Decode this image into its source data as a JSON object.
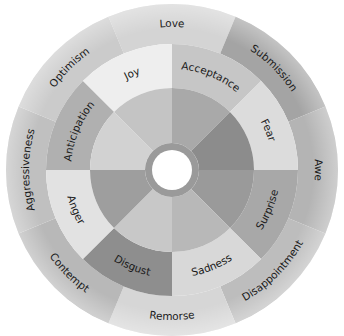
{
  "diagram": {
    "center": [
      172,
      170
    ],
    "radii": {
      "hub": 20,
      "hub_ring": 27,
      "inner": 82,
      "middle": 126,
      "outer": 166
    },
    "primary_emotions": [
      {
        "label": "Joy",
        "angle": -112.5,
        "fill": "#eeeeee",
        "inner_fill": "#c4c4c4"
      },
      {
        "label": "Acceptance",
        "angle": -67.5,
        "fill": "#c6c6c6",
        "inner_fill": "#a9a9a9"
      },
      {
        "label": "Fear",
        "angle": -22.5,
        "fill": "#dcdcdc",
        "inner_fill": "#8c8c8c"
      },
      {
        "label": "Surprise",
        "angle": 22.5,
        "fill": "#a8a8a8",
        "inner_fill": "#9a9a9a"
      },
      {
        "label": "Sadness",
        "angle": 67.5,
        "fill": "#d8d8d8",
        "inner_fill": "#b8b8b8"
      },
      {
        "label": "Disgust",
        "angle": 112.5,
        "fill": "#8e8e8e",
        "inner_fill": "#c8c8c8"
      },
      {
        "label": "Anger",
        "angle": 157.5,
        "fill": "#e2e2e2",
        "inner_fill": "#9e9e9e"
      },
      {
        "label": "Anticipation",
        "angle": -157.5,
        "fill": "#b0b0b0",
        "inner_fill": "#d2d2d2"
      }
    ],
    "dyads": [
      {
        "label": "Love",
        "angle": -90,
        "fill": "#d4d4d4"
      },
      {
        "label": "Submission",
        "angle": -45,
        "fill": "#a4a4a4"
      },
      {
        "label": "Awe",
        "angle": 0,
        "fill": "#b4b4b4"
      },
      {
        "label": "Disappointment",
        "angle": 45,
        "fill": "#bdbdbd"
      },
      {
        "label": "Remorse",
        "angle": 90,
        "fill": "#d6d6d6"
      },
      {
        "label": "Contempt",
        "angle": 135,
        "fill": "#b8b8b8"
      },
      {
        "label": "Aggressiveness",
        "angle": 180,
        "fill": "#c0c0c0"
      },
      {
        "label": "Optimism",
        "angle": -135,
        "fill": "#cbcbcb"
      }
    ],
    "hub_colors": {
      "ring": "#9a9a9a",
      "center": "#ffffff"
    }
  }
}
